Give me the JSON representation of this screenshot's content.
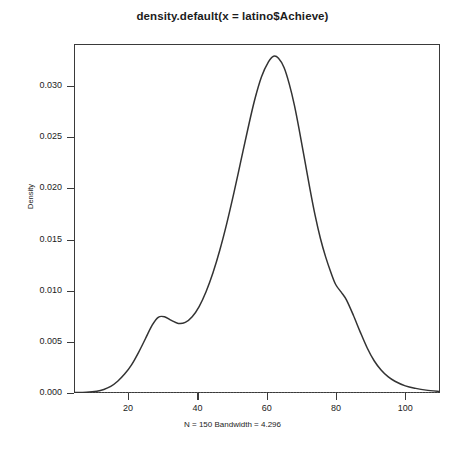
{
  "chart_data": {
    "type": "line",
    "title": "density.default(x = latino$Achieve)",
    "subtitle": "N = 150   Bandwidth = 4.296",
    "xlabel": "N = 150   Bandwidth = 4.296",
    "ylabel": "Density",
    "xlim": [
      4.4,
      110.0
    ],
    "ylim": [
      0.0,
      0.0341
    ],
    "grid": false,
    "legend": null,
    "x_ticks": [
      20,
      40,
      60,
      80,
      100
    ],
    "x_tick_labels": [
      "20",
      "40",
      "60",
      "80",
      "100"
    ],
    "y_ticks": [
      0.0,
      0.005,
      0.01,
      0.015,
      0.02,
      0.025,
      0.03
    ],
    "y_tick_labels": [
      "0.000",
      "0.005",
      "0.010",
      "0.015",
      "0.020",
      "0.025",
      "0.030"
    ],
    "series": [
      {
        "name": "density",
        "color": "#333333",
        "x": [
          4.4,
          8.0,
          11.0,
          13.0,
          15.0,
          17.0,
          19.0,
          21.0,
          23.0,
          25.0,
          27.0,
          28.7,
          30.5,
          32.5,
          34.5,
          36.5,
          38.5,
          40.5,
          42.5,
          44.5,
          46.5,
          48.5,
          50.5,
          52.5,
          54.5,
          56.5,
          58.5,
          60.5,
          62.0,
          63.4,
          65.0,
          66.5,
          68.0,
          69.5,
          71.0,
          72.5,
          74.0,
          75.5,
          77.0,
          78.5,
          79.9,
          81.5,
          83.0,
          85.0,
          87.0,
          89.0,
          91.0,
          93.0,
          95.0,
          97.0,
          100.0,
          103.0,
          106.0,
          110.0
        ],
        "y": [
          5e-05,
          8e-05,
          0.00018,
          0.00035,
          0.00065,
          0.00115,
          0.00185,
          0.00275,
          0.00395,
          0.0053,
          0.00665,
          0.0074,
          0.00745,
          0.0071,
          0.0068,
          0.0069,
          0.00745,
          0.00845,
          0.0099,
          0.01175,
          0.014,
          0.0166,
          0.0195,
          0.0226,
          0.0257,
          0.0286,
          0.0309,
          0.03235,
          0.0329,
          0.0327,
          0.0318,
          0.0302,
          0.0281,
          0.0255,
          0.0227,
          0.0199,
          0.0173,
          0.0151,
          0.0133,
          0.0118,
          0.0106,
          0.00985,
          0.0091,
          0.0076,
          0.00595,
          0.0044,
          0.00315,
          0.00225,
          0.0016,
          0.00115,
          0.0007,
          0.00045,
          0.00028,
          0.00015
        ]
      }
    ],
    "annotations": {
      "peak_x": 63.4,
      "peak_y": 0.0327,
      "left_mode_x": 28.7,
      "left_mode_y": 0.0074,
      "right_shoulder_x": 79.9,
      "right_shoulder_y": 0.01
    }
  },
  "axis": {
    "frame_color": "#3a3a3a",
    "line_color": "#333333"
  }
}
